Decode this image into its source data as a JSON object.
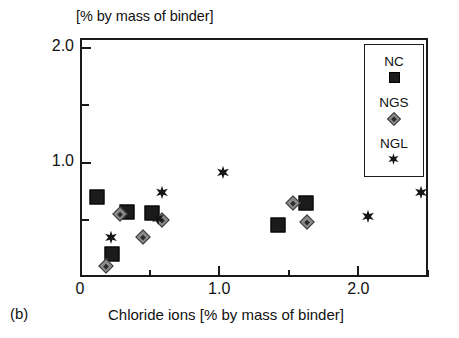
{
  "figure": {
    "panel_tag": "(b)",
    "top_unit_label": "[% by mass of binder]"
  },
  "chart_data": {
    "type": "scatter",
    "title": "",
    "xlabel": "Chloride ions [% by mass of binder]",
    "ylabel": "Adsorbed chlorides",
    "top_unit": "[% by mass of binder]",
    "xlim": [
      0,
      2.5
    ],
    "ylim": [
      0,
      2.25
    ],
    "xticks": [
      0,
      1.0,
      2.0
    ],
    "xticklabels": [
      "0",
      "1.0",
      "2.0"
    ],
    "x_minor_ticks": [
      0.5,
      1.5,
      2.5
    ],
    "yticks": [
      1.0,
      2.0
    ],
    "yticklabels": [
      "1.0",
      "2.0"
    ],
    "y_minor_ticks": [
      0.5,
      1.5
    ],
    "grid": false,
    "legend_position": "top-right",
    "series": [
      {
        "name": "NC",
        "marker": "filled-square",
        "color": "#1b1b1b",
        "points": [
          {
            "x": 0.12,
            "y": 0.7
          },
          {
            "x": 0.23,
            "y": 0.2
          },
          {
            "x": 0.34,
            "y": 0.57
          },
          {
            "x": 0.52,
            "y": 0.56
          },
          {
            "x": 1.42,
            "y": 0.45
          },
          {
            "x": 1.62,
            "y": 0.65
          }
        ]
      },
      {
        "name": "NGS",
        "marker": "crossed-diamond",
        "color": "#8a8a8a",
        "points": [
          {
            "x": 0.19,
            "y": 0.1
          },
          {
            "x": 0.29,
            "y": 0.55
          },
          {
            "x": 0.45,
            "y": 0.35
          },
          {
            "x": 0.59,
            "y": 0.5
          },
          {
            "x": 1.53,
            "y": 0.65
          },
          {
            "x": 1.63,
            "y": 0.48
          }
        ]
      },
      {
        "name": "NGL",
        "marker": "six-point-star",
        "color": "#161616",
        "points": [
          {
            "x": 0.22,
            "y": 0.34
          },
          {
            "x": 0.56,
            "y": 0.51
          },
          {
            "x": 0.59,
            "y": 0.73
          },
          {
            "x": 1.03,
            "y": 0.91
          },
          {
            "x": 2.07,
            "y": 0.52
          },
          {
            "x": 2.45,
            "y": 0.73
          }
        ]
      }
    ]
  },
  "legend": {
    "entries": [
      {
        "label": "NC",
        "marker": "filled-square"
      },
      {
        "label": "NGS",
        "marker": "crossed-diamond"
      },
      {
        "label": "NGL",
        "marker": "six-point-star"
      }
    ]
  }
}
